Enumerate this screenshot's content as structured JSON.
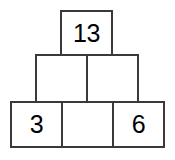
{
  "figure": {
    "name": "number-pyramid",
    "background_color": "#ffffff",
    "border_color": "#3a3a3a",
    "text_color": "#000000"
  },
  "chart_data": {
    "type": "table",
    "title": "",
    "xlabel": "",
    "ylabel": "",
    "rows": [
      {
        "level": "top",
        "cells": [
          {
            "value": "13",
            "filled": true
          }
        ]
      },
      {
        "level": "middle",
        "cells": [
          {
            "value": "",
            "filled": false
          },
          {
            "value": "",
            "filled": false
          }
        ]
      },
      {
        "level": "bottom",
        "cells": [
          {
            "value": "3",
            "filled": true
          },
          {
            "value": "",
            "filled": false
          },
          {
            "value": "6",
            "filled": true
          }
        ]
      }
    ]
  }
}
